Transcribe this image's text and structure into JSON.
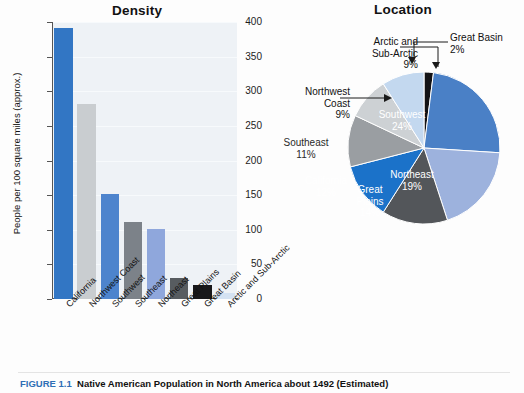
{
  "figure": {
    "caption_number": "FIGURE 1.1",
    "caption_text": "Native American Population in North America about 1492 (Estimated)"
  },
  "bar_panel": {
    "title": "Density"
  },
  "pie_panel": {
    "title": "Location"
  },
  "chart_data": [
    {
      "type": "bar",
      "title": "Density",
      "xlabel": "",
      "ylabel": "People per 100 square miles (approx.)",
      "ylim": [
        0,
        400
      ],
      "yticks": [
        "0",
        "50",
        "100",
        "150",
        "200",
        "250",
        "300",
        "350",
        "400"
      ],
      "grid": true,
      "legend": "none",
      "categories": [
        "California",
        "Northwest Coast",
        "Southwest",
        "Southeast",
        "Northeast",
        "Great Plains",
        "Great Basin",
        "Arctic and Sub-Arctic"
      ],
      "values": [
        392,
        281,
        151,
        111,
        101,
        30,
        20,
        8
      ],
      "colors": [
        "#3276c4",
        "#c9cdd0",
        "#4d84cd",
        "#7c8289",
        "#8fa7dc",
        "#575c60",
        "#18181a",
        "#d4e2f2"
      ]
    },
    {
      "type": "pie",
      "title": "Location",
      "legend": "none",
      "labels": [
        "Great Basin",
        "Southwest",
        "Northeast",
        "Great Plains",
        "California",
        "Southeast",
        "Northwest Coast",
        "Arctic and Sub-Arctic"
      ],
      "values": [
        2,
        24,
        19,
        14,
        12,
        11,
        9,
        9
      ],
      "value_labels": [
        "2%",
        "24%",
        "19%",
        "14%",
        "12%",
        "11%",
        "9%",
        "9%"
      ],
      "colors": [
        "#131316",
        "#4a80c6",
        "#9db2dd",
        "#53565a",
        "#1b72c9",
        "#9a9ea2",
        "#cdd1d4",
        "#c3d8ef"
      ],
      "slice_labels": [
        {
          "text": "Southwest\n24%",
          "style": "light",
          "left": "140",
          "top": "95"
        },
        {
          "text": "Northeast\n19%",
          "style": "light",
          "left": "150",
          "top": "155"
        },
        {
          "text": "Great\nPlains\n14%",
          "style": "light",
          "left": "108",
          "top": "170"
        },
        {
          "text": "California\n12%",
          "style": "light",
          "left": "64",
          "top": "161"
        },
        {
          "text": "Southeast\n11%",
          "style": "dark",
          "left": "44",
          "top": "123"
        }
      ],
      "callouts": [
        {
          "id": "arctic",
          "text": "Arctic and\nSub-Arctic\n9%"
        },
        {
          "id": "nwcoast",
          "text": "Northwest\nCoast\n9%"
        },
        {
          "id": "greatbasin",
          "text": "Great Basin\n2%"
        }
      ]
    }
  ]
}
